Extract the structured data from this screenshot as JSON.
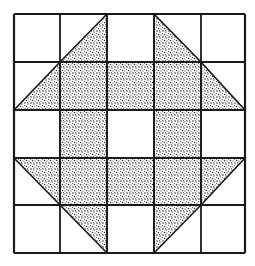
{
  "diagram": {
    "type": "quilt-block",
    "rows": 5,
    "cols": 5,
    "colors": {
      "background": "#ffffff",
      "line": "#1a1a1a",
      "stipple_dark": "#2b2b2b",
      "stipple_light": "#ffffff"
    },
    "cells": [
      [
        "empty",
        "tri-br",
        "empty",
        "tri-bl",
        "empty"
      ],
      [
        "tri-br",
        "full",
        "full",
        "full",
        "tri-bl"
      ],
      [
        "empty",
        "full",
        "empty",
        "full",
        "empty"
      ],
      [
        "tri-tr",
        "full",
        "full",
        "full",
        "tri-tl"
      ],
      [
        "empty",
        "tri-tr",
        "empty",
        "tri-tl",
        "empty"
      ]
    ]
  }
}
